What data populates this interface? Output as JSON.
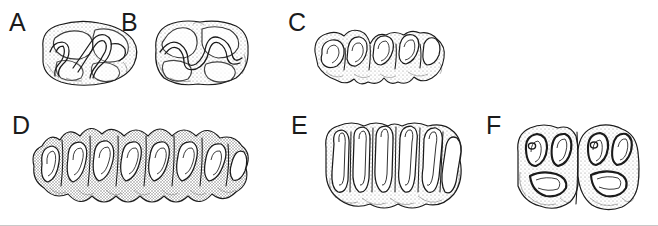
{
  "figure": {
    "background_color": "#ffffff",
    "ink_color": "#1b1b1b",
    "stipple_color": "#8a8a8a",
    "border_color": "#c8c8c8",
    "width": 658,
    "height": 226,
    "rows": 2,
    "columns": 3,
    "style": "pen-and-ink stipple line drawing"
  },
  "panels": [
    {
      "id": "A",
      "label": "A",
      "row": 1,
      "column": 1,
      "crown_type": "bunodont",
      "description": "Low-crowned molar with rounded bulbous cusps and a simple sinuous enamel valley",
      "cusp_count": 4,
      "outline": "broad oval, wider than tall"
    },
    {
      "id": "B",
      "label": "B",
      "row": 1,
      "column": 2,
      "crown_type": "bunodont",
      "description": "Rounded multicuspid crown with paired lingual and buccal cusps separated by a central transverse valley",
      "cusp_count": 4,
      "outline": "rounded rectangular"
    },
    {
      "id": "C",
      "label": "C",
      "row": 1,
      "column": 3,
      "crown_type": "lophodont",
      "description": "Two-tooth row with looped transverse enamel lophs forming repeated crescent ridges",
      "cusp_count": 6,
      "outline": "elongate, scalloped margin"
    },
    {
      "id": "D",
      "label": "D",
      "row": 2,
      "column": 1,
      "crown_type": "selenodont",
      "description": "Elongate tooth row with deeply infolded crescentic enamel lakes and sharp projecting styles",
      "cusp_count": 8,
      "outline": "long, strongly indented"
    },
    {
      "id": "E",
      "label": "E",
      "row": 2,
      "column": 2,
      "crown_type": "hypsodont",
      "description": "High-crowned molars with tall narrow parallel enamel plates and deep linear infoldings",
      "cusp_count": 6,
      "outline": "squared with vertical fluting"
    },
    {
      "id": "F",
      "label": "F",
      "row": 2,
      "column": 3,
      "crown_type": "lophodont",
      "description": "Paired molars with heavy dark enamel bands enclosing looped fossettes and a basal cingulum",
      "cusp_count": 4,
      "outline": "two adjoining squared crowns"
    }
  ]
}
